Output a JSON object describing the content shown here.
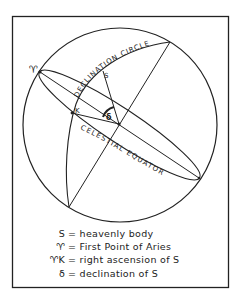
{
  "figure": {
    "labels": {
      "aries": "♈",
      "star": "S",
      "k_point": "K",
      "delta": "δ",
      "declination_circle": "DECLINATION CIRCLE",
      "celestial_equator": "CELESTIAL EQUATOR"
    },
    "colors": {
      "ink": "#222222",
      "background": "#ffffff"
    }
  },
  "legend": {
    "items": [
      {
        "symbol": "S",
        "text": "= heavenly  body"
      },
      {
        "symbol": "♈",
        "text": "= First  Point  of  Aries"
      },
      {
        "symbol": "♈K",
        "text": "= right  ascension  of  S"
      },
      {
        "symbol": "δ",
        "text": "= declination  of  S"
      }
    ]
  }
}
